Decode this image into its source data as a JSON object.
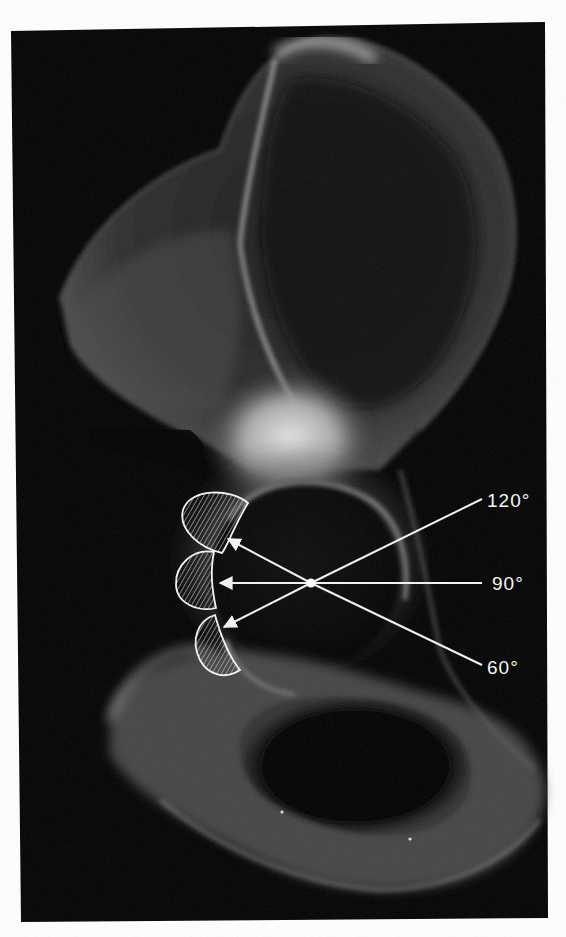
{
  "figure": {
    "background_color": "#000000",
    "page_color": "#ffffff",
    "annotation_color": "#f2f2f2"
  },
  "annotations": {
    "center_point": {
      "x": 311,
      "y": 583
    },
    "vectors": [
      {
        "label": "120°",
        "start": {
          "x": 482,
          "y": 499
        },
        "arrow_tip": {
          "x": 227,
          "y": 538
        },
        "label_pos": {
          "x": 487,
          "y": 507
        }
      },
      {
        "label": "90°",
        "start": {
          "x": 482,
          "y": 583
        },
        "arrow_tip": {
          "x": 218,
          "y": 583
        },
        "label_pos": {
          "x": 492,
          "y": 590
        }
      },
      {
        "label": "60°",
        "start": {
          "x": 482,
          "y": 665
        },
        "arrow_tip": {
          "x": 222,
          "y": 628
        },
        "label_pos": {
          "x": 487,
          "y": 674
        }
      }
    ],
    "hatched_regions": [
      {
        "name": "superior-load-zone",
        "angle": "120°"
      },
      {
        "name": "central-load-zone",
        "angle": "90°"
      },
      {
        "name": "inferior-load-zone",
        "angle": "60°"
      }
    ]
  }
}
